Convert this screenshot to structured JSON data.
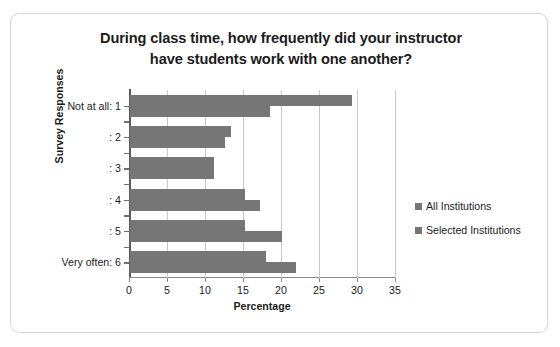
{
  "chart_data": {
    "type": "bar",
    "orientation": "horizontal",
    "title": "During class time, how frequently did your instructor have students work with one another?",
    "title_lines": [
      "During class time, how frequently did your instructor",
      "have students work with one another?"
    ],
    "xlabel": "Percentage",
    "ylabel": "Survey Responses",
    "categories": [
      "Not at all: 1",
      ": 2",
      ": 3",
      ": 4",
      ": 5",
      "Very often: 6"
    ],
    "series": [
      {
        "name": "All Institutions",
        "color": "#767676",
        "values": [
          29.2,
          13.3,
          11.0,
          15.1,
          15.1,
          17.9
        ]
      },
      {
        "name": "Selected Institutions",
        "color": "#767676",
        "values": [
          18.4,
          12.5,
          11.0,
          17.1,
          20.0,
          21.8
        ]
      }
    ],
    "xlim": [
      0,
      35
    ],
    "xticks": [
      0,
      5,
      10,
      15,
      20,
      25,
      30,
      35
    ],
    "xtick_labels": [
      "0",
      "5",
      "10",
      "15",
      "20",
      "25",
      "30",
      "35"
    ],
    "grid": "vertical",
    "legend_position": "right",
    "legend_entries": [
      "All Institutions",
      "Selected Institutions"
    ]
  }
}
